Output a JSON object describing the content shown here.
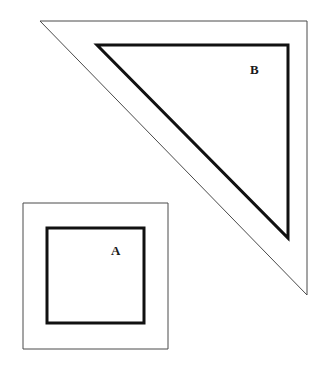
{
  "figure": {
    "background_color": "#ffffff",
    "outer_stroke_color": "#4a4a4a",
    "inner_stroke_color": "#111111",
    "outer_stroke_width": 1,
    "inner_stroke_width": 3,
    "shapes": [
      {
        "id": "shape-A",
        "label": "A",
        "type": "square",
        "outer_points": "23,203 168,203 168,349 23,349",
        "inner_points": "47,228 144,228 144,323 47,323",
        "label_x": 116,
        "label_y": 250
      },
      {
        "id": "shape-B",
        "label": "B",
        "type": "right-triangle",
        "outer_points": "40,21 307,21 307,295",
        "inner_points": "97,45 288,45 288,238",
        "label_x": 254,
        "label_y": 70
      }
    ]
  },
  "labels": {
    "square_label": "A",
    "triangle_label": "B"
  }
}
